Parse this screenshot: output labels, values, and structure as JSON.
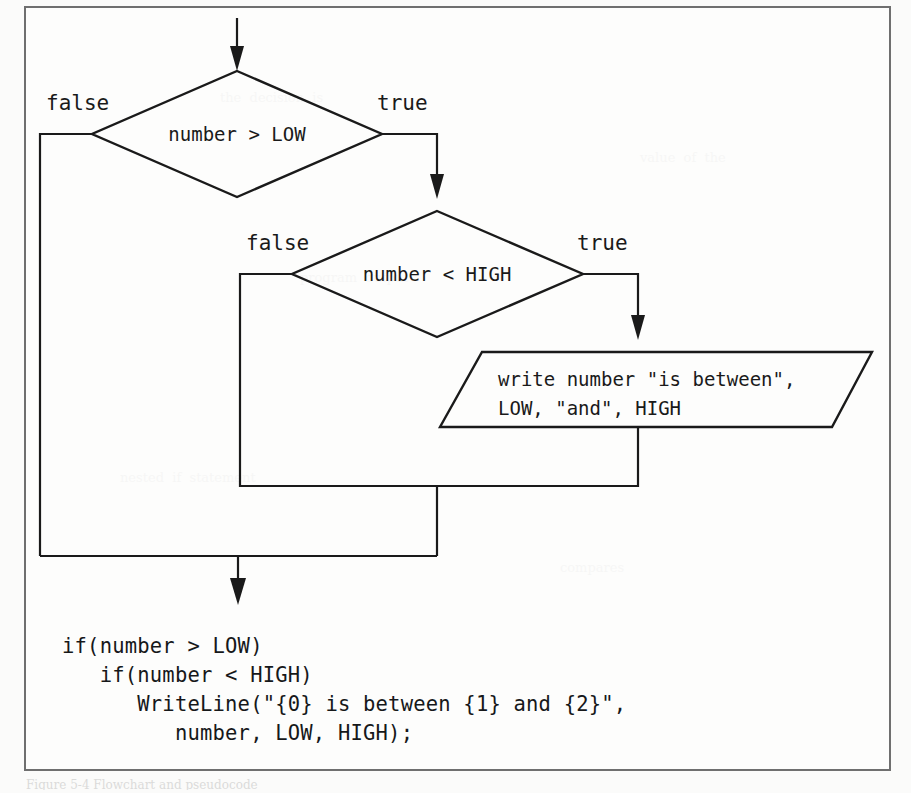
{
  "figure": {
    "domain": "diagram",
    "kind": "flowchart",
    "caption_partial": "Figure 5-4  Flowchart and pseudocode"
  },
  "colors": {
    "ink": "#1a1a1a",
    "frame": "#6f6f6f",
    "page": "#fdfdfc"
  },
  "nodes": {
    "decision_1": {
      "id": "decision-number-gt-low",
      "text": "number > LOW",
      "shape": "diamond"
    },
    "decision_2": {
      "id": "decision-number-lt-high",
      "text": "number < HIGH",
      "shape": "diamond"
    },
    "output_1": {
      "id": "output-write-between",
      "shape": "parallelogram",
      "line1": "write number \"is between\",",
      "line2": "LOW, \"and\", HIGH"
    }
  },
  "branch_labels": {
    "d1_false": "false",
    "d1_true": "true",
    "d2_false": "false",
    "d2_true": "true"
  },
  "code": {
    "line1": "if(number > LOW)",
    "line2": "   if(number < HIGH)",
    "line3": "      WriteLine(\"{0} is between {1} and {2}\",",
    "line4": "         number, LOW, HIGH);"
  },
  "bleedthrough": {
    "b1": "the  decision  is",
    "b2": "program  output",
    "b3": "nested  if  statement",
    "b4": "value  of  the",
    "b5": "compares"
  }
}
